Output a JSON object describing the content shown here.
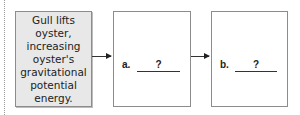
{
  "diagram": {
    "steps": [
      {
        "text": "Gull lifts oyster, increasing oyster's gravitational potential energy."
      },
      {
        "label": "a.",
        "placeholder": "?"
      },
      {
        "label": "b.",
        "placeholder": "?"
      }
    ],
    "arrows": [
      "right-arrow",
      "right-arrow"
    ],
    "colors": {
      "first_box_fill": "#e8e8e8",
      "box_border": "#8c8c8c",
      "arrow": "#222222"
    }
  }
}
